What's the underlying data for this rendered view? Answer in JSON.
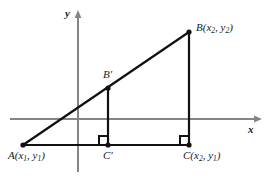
{
  "figure": {
    "background_color": "#ffffff",
    "axis_color": "#808080",
    "line_color": "#111111",
    "width": 272,
    "height": 180
  },
  "axes": {
    "x_label": "x",
    "y_label": "y",
    "x_axis": {
      "x1": 10,
      "y1": 119,
      "x2": 262,
      "y2": 119,
      "arrow": "right"
    },
    "y_axis": {
      "x1": 78,
      "y1": 10,
      "x2": 78,
      "y2": 172,
      "arrow": "up"
    },
    "x_label_pos": {
      "x": 248,
      "y": 126
    },
    "y_label_pos": {
      "x": 64,
      "y": 8
    }
  },
  "points": [
    {
      "id": "A",
      "label_main": "A",
      "label_paren_open": "(",
      "label_x": "x",
      "label_xsub": "1",
      "label_sep": ", ",
      "label_y": "y",
      "label_ysub": "1",
      "label_paren_close": ")",
      "cx": 23,
      "cy": 145
    },
    {
      "id": "B",
      "label_main": "B",
      "label_paren_open": "(",
      "label_x": "x",
      "label_xsub": "2",
      "label_sep": ", ",
      "label_y": "y",
      "label_ysub": "2",
      "label_paren_close": ")",
      "cx": 189,
      "cy": 32
    },
    {
      "id": "C",
      "label_main": "C",
      "label_paren_open": "(",
      "label_x": "x",
      "label_xsub": "2",
      "label_sep": ", ",
      "label_y": "y",
      "label_ysub": "1",
      "label_paren_close": ")",
      "cx": 189,
      "cy": 145
    },
    {
      "id": "Bp",
      "label_main": "B",
      "label_prime": "'",
      "cx": 108,
      "cy": 88
    },
    {
      "id": "Cp",
      "label_main": "C",
      "label_prime": "'",
      "cx": 108,
      "cy": 145
    }
  ],
  "labels": {
    "A": {
      "main": "A",
      "open": "(",
      "x": "x",
      "xsub": "1",
      "sep": ", ",
      "y": "y",
      "ysub": "1",
      "close": ")"
    },
    "B": {
      "main": "B",
      "open": "(",
      "x": "x",
      "xsub": "2",
      "sep": ", ",
      "y": "y",
      "ysub": "2",
      "close": ")"
    },
    "C": {
      "main": "C",
      "open": "(",
      "x": "x",
      "xsub": "2",
      "sep": ", ",
      "y": "y",
      "ysub": "1",
      "close": ")"
    },
    "Bprime": "B'",
    "Cprime": "C'"
  },
  "segments": [
    {
      "name": "hypotenuse-AB",
      "x1": 23,
      "y1": 145,
      "x2": 189,
      "y2": 32
    },
    {
      "name": "base-AC",
      "x1": 23,
      "y1": 145,
      "x2": 189,
      "y2": 145
    },
    {
      "name": "vertical-BC",
      "x1": 189,
      "y1": 32,
      "x2": 189,
      "y2": 145
    },
    {
      "name": "vertical-BpCp",
      "x1": 108,
      "y1": 88,
      "x2": 108,
      "y2": 145
    }
  ],
  "right_angles": [
    {
      "name": "right-angle-at-Cprime",
      "x": 99,
      "y": 136,
      "size": 9
    },
    {
      "name": "right-angle-at-C",
      "x": 180,
      "y": 136,
      "size": 9
    }
  ]
}
